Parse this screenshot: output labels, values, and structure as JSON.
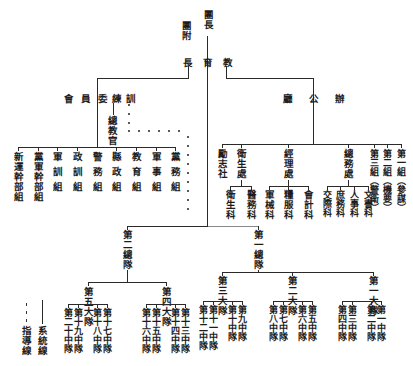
{
  "top": {
    "commander": "團長",
    "deputy": "團附",
    "education_chief": [
      "長",
      "育",
      "教"
    ]
  },
  "training_committee": {
    "label": [
      "會",
      "員",
      "委",
      "練",
      "訓"
    ],
    "chief_instructor": "總教官",
    "groups": [
      "新運幹部組",
      "黨軍幹部組",
      "軍訓組",
      "政訓組",
      "警務組",
      "縣政組",
      "教育組",
      "軍事組",
      "黨務組"
    ]
  },
  "office": {
    "label": [
      "廳",
      "公",
      "辦"
    ],
    "units": [
      {
        "name": "勵志社",
        "subs": []
      },
      {
        "name": "衛生處",
        "subs": [
          "衛生科",
          "醫務科"
        ]
      },
      {
        "name": "經理處",
        "subs": [
          "軍械科",
          "糧服科",
          "會計科"
        ]
      },
      {
        "name": "總務處",
        "subs": [
          "交際科",
          "庶務科",
          "人事科",
          "文書科"
        ]
      },
      {
        "name": "第三組（警衛）",
        "subs": []
      },
      {
        "name": "第二組（機要）",
        "subs": []
      },
      {
        "name": "第一組（參謀）",
        "subs": []
      }
    ]
  },
  "corps": [
    {
      "name": "第二總隊",
      "brigades": [
        {
          "name": "第五大隊",
          "companies": [
            "第二十中隊",
            "第十九中隊",
            "第十八中隊",
            "第十七中隊"
          ]
        },
        {
          "name": "第四大隊",
          "companies": [
            "第十六中隊",
            "第十五中隊",
            "第十四中隊",
            "第十三中隊"
          ]
        }
      ]
    },
    {
      "name": "第一總隊",
      "brigades": [
        {
          "name": "第三大隊",
          "companies": [
            "第十二中隊",
            "第十一中隊",
            "第十中隊",
            "第九中隊"
          ]
        },
        {
          "name": "第二大隊",
          "companies": [
            "第八中隊",
            "第七中隊",
            "第六中隊",
            "第五中隊"
          ]
        },
        {
          "name": "第一大隊",
          "companies": [
            "第四中隊",
            "第三中隊",
            "第二中隊",
            "第一中隊"
          ]
        }
      ]
    }
  ],
  "legend": {
    "solid": "系統線",
    "dotted": "指導線"
  }
}
